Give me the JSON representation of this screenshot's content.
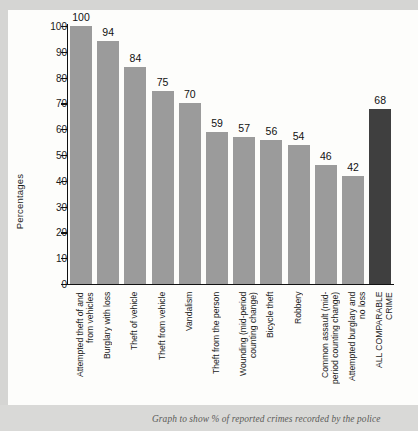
{
  "chart_data": {
    "type": "bar",
    "title": "",
    "xlabel": "",
    "ylabel": "Percentages",
    "ylim": [
      0,
      100
    ],
    "ytick_labels": [
      "100",
      "90",
      "80",
      "70",
      "60",
      "50",
      "40",
      "30",
      "20",
      "10",
      "0"
    ],
    "ytick_values": [
      100,
      90,
      80,
      70,
      60,
      50,
      40,
      30,
      20,
      10,
      0
    ],
    "grid": false,
    "legend": "none",
    "categories": [
      "Attempted theft of and\nfrom vehicles",
      "Burglary with loss",
      "Theft of vehicle",
      "Theft from vehicle",
      "Vandalism",
      "Theft from the person",
      "Wounding (mid-period\ncounting change)",
      "Bicycle theft",
      "Robbery",
      "Common assault (mid-\nperiod counting change)",
      "Attempted burglary and\nno loss",
      "ALL COMPARABLE\nCRIME"
    ],
    "values": [
      100,
      94,
      84,
      75,
      70,
      59,
      57,
      56,
      54,
      46,
      42,
      68
    ],
    "value_labels": [
      "100",
      "94",
      "84",
      "75",
      "70",
      "59",
      "57",
      "56",
      "54",
      "46",
      "42",
      "68"
    ],
    "bar_colors": [
      "#9b9b9b",
      "#9b9b9b",
      "#9b9b9b",
      "#9b9b9b",
      "#9b9b9b",
      "#9b9b9b",
      "#9b9b9b",
      "#9b9b9b",
      "#9b9b9b",
      "#9b9b9b",
      "#9b9b9b",
      "#3f3f3f"
    ],
    "highlight_index": 11,
    "highlight_color": "#3f3f3f",
    "series_color": "#9b9b9b"
  },
  "caption": {
    "text": "Graph to show % of reported crimes recorded by the police"
  }
}
